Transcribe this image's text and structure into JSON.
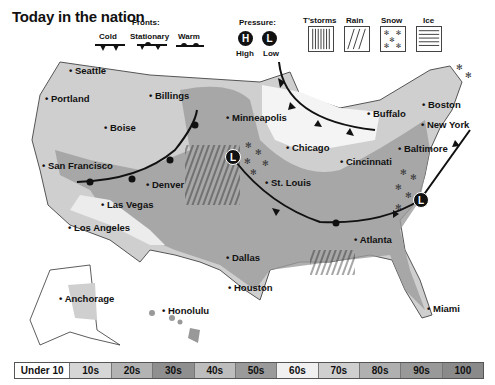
{
  "title": "Today in the nation",
  "legend": {
    "fronts_heading": "Fronts:",
    "fronts": [
      {
        "label": "Cold",
        "icon": "cold-front-icon"
      },
      {
        "label": "Stationary",
        "icon": "stationary-front-icon"
      },
      {
        "label": "Warm",
        "icon": "warm-front-icon"
      }
    ],
    "pressure_heading": "Pressure:",
    "pressure": [
      {
        "symbol": "H",
        "label": "High"
      },
      {
        "symbol": "L",
        "label": "Low"
      }
    ],
    "precip": [
      {
        "label": "T'storms",
        "icon": "tstorms-pattern-icon"
      },
      {
        "label": "Rain",
        "icon": "rain-pattern-icon"
      },
      {
        "label": "Snow",
        "icon": "snow-pattern-icon"
      },
      {
        "label": "Ice",
        "icon": "ice-pattern-icon"
      }
    ]
  },
  "cities": [
    {
      "name": "Seattle",
      "x": 69,
      "y": 71
    },
    {
      "name": "Portland",
      "x": 45,
      "y": 99
    },
    {
      "name": "Boise",
      "x": 104,
      "y": 128
    },
    {
      "name": "Billings",
      "x": 149,
      "y": 96
    },
    {
      "name": "San Francisco",
      "x": 42,
      "y": 166
    },
    {
      "name": "Denver",
      "x": 146,
      "y": 185
    },
    {
      "name": "Las Vegas",
      "x": 101,
      "y": 205
    },
    {
      "name": "Los Angeles",
      "x": 68,
      "y": 228
    },
    {
      "name": "Minneapolis",
      "x": 226,
      "y": 118
    },
    {
      "name": "Chicago",
      "x": 286,
      "y": 148
    },
    {
      "name": "St. Louis",
      "x": 265,
      "y": 183
    },
    {
      "name": "Cincinnati",
      "x": 340,
      "y": 162
    },
    {
      "name": "Buffalo",
      "x": 367,
      "y": 114
    },
    {
      "name": "Boston",
      "x": 422,
      "y": 105
    },
    {
      "name": "New York",
      "x": 421,
      "y": 125
    },
    {
      "name": "Baltimore",
      "x": 398,
      "y": 149
    },
    {
      "name": "Atlanta",
      "x": 354,
      "y": 240
    },
    {
      "name": "Dallas",
      "x": 226,
      "y": 258
    },
    {
      "name": "Houston",
      "x": 228,
      "y": 288
    },
    {
      "name": "Miami",
      "x": 427,
      "y": 309
    },
    {
      "name": "Anchorage",
      "x": 59,
      "y": 299
    },
    {
      "name": "Honolulu",
      "x": 162,
      "y": 311
    }
  ],
  "pressure_centers": [
    {
      "symbol": "L",
      "x": 233,
      "y": 157
    },
    {
      "symbol": "L",
      "x": 421,
      "y": 200
    }
  ],
  "temperature_scale": [
    "Under 10",
    "10s",
    "20s",
    "30s",
    "40s",
    "50s",
    "60s",
    "70s",
    "80s",
    "90s",
    "100"
  ],
  "temperature_colors": [
    "#ffffff",
    "#d6d6d6",
    "#b3b3b3",
    "#8f8f8f",
    "#bdbdbd",
    "#9a9a9a",
    "#f0f0f0",
    "#cfcfcf",
    "#b0b0b0",
    "#999999",
    "#8a8a8a"
  ]
}
